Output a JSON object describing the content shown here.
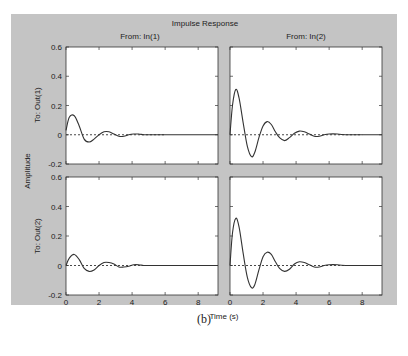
{
  "figure": {
    "title": "Impulse Response",
    "caption": "(b)",
    "xlabel": "Time (s)",
    "ylabel": "Amplitude",
    "background_color": "#c4c4c4",
    "axes_color": "#ffffff",
    "line_color": "#333333"
  },
  "chart_data": {
    "type": "line",
    "title": "Impulse Response",
    "xlabel": "Time (s)",
    "ylabel": "Amplitude",
    "xlim": [
      0,
      9.2
    ],
    "ylim": [
      -0.2,
      0.6
    ],
    "xticks": [
      0,
      2,
      4,
      6,
      8
    ],
    "yticks": [
      -0.2,
      0,
      0.2,
      0.4,
      0.6
    ],
    "ytick_labels": [
      "-0.2",
      "0",
      "0.2",
      "0.4",
      "0.6"
    ],
    "grid": false,
    "column_titles": [
      "From: In(1)",
      "From: In(2)"
    ],
    "row_titles": [
      "To: Out(1)",
      "To: Out(2)"
    ],
    "subplots": [
      {
        "row": 0,
        "col": 0,
        "from": "In(1)",
        "to": "Out(1)",
        "series": [
          {
            "name": "response",
            "style": "solid",
            "x": [
              0,
              0.2,
              0.5,
              0.8,
              1.1,
              1.4,
              1.7,
              2.0,
              2.3,
              2.6,
              2.9,
              3.2,
              3.5,
              3.8,
              4.1,
              4.4,
              4.7,
              5.0,
              5.5,
              6.0,
              9.2
            ],
            "y": [
              0.03,
              0.12,
              0.13,
              0.06,
              -0.03,
              -0.05,
              -0.03,
              0.0,
              0.02,
              0.02,
              0.005,
              -0.01,
              -0.01,
              0.0,
              0.005,
              0.005,
              0.0,
              0.0,
              0.0,
              0.0,
              0.0
            ]
          },
          {
            "name": "reference",
            "style": "dashed",
            "x": [
              0,
              6.0
            ],
            "y": [
              0,
              0
            ]
          }
        ]
      },
      {
        "row": 0,
        "col": 1,
        "from": "In(2)",
        "to": "Out(1)",
        "series": [
          {
            "name": "response",
            "style": "solid",
            "x": [
              0,
              0.15,
              0.35,
              0.55,
              0.8,
              1.05,
              1.3,
              1.5,
              1.75,
              2.0,
              2.25,
              2.5,
              2.75,
              3.0,
              3.3,
              3.6,
              3.9,
              4.2,
              4.5,
              4.8,
              5.1,
              5.4,
              5.7,
              6.0,
              6.5,
              7.0,
              9.2
            ],
            "y": [
              0.0,
              0.2,
              0.31,
              0.25,
              0.08,
              -0.08,
              -0.15,
              -0.12,
              -0.02,
              0.06,
              0.09,
              0.07,
              0.02,
              -0.02,
              -0.04,
              -0.02,
              0.01,
              0.025,
              0.02,
              0.005,
              -0.01,
              -0.01,
              0.0,
              0.005,
              0.005,
              0.0,
              0.0
            ]
          },
          {
            "name": "reference",
            "style": "dashed",
            "x": [
              0,
              8.0
            ],
            "y": [
              0,
              0
            ]
          }
        ]
      },
      {
        "row": 1,
        "col": 0,
        "from": "In(1)",
        "to": "Out(2)",
        "series": [
          {
            "name": "response",
            "style": "solid",
            "x": [
              0,
              0.2,
              0.5,
              0.8,
              1.1,
              1.4,
              1.7,
              2.0,
              2.3,
              2.6,
              2.9,
              3.2,
              3.5,
              3.8,
              4.1,
              4.4,
              4.7,
              5.0,
              5.5,
              6.0,
              9.2
            ],
            "y": [
              0.0,
              0.05,
              0.075,
              0.04,
              -0.02,
              -0.04,
              -0.03,
              0.0,
              0.02,
              0.02,
              0.01,
              -0.01,
              -0.01,
              -0.005,
              0.005,
              0.005,
              0.0,
              0.0,
              0.0,
              0.0,
              0.0
            ]
          },
          {
            "name": "reference",
            "style": "dashed",
            "x": [
              0,
              6.0
            ],
            "y": [
              0,
              0
            ]
          }
        ]
      },
      {
        "row": 1,
        "col": 1,
        "from": "In(2)",
        "to": "Out(2)",
        "series": [
          {
            "name": "response",
            "style": "solid",
            "x": [
              0,
              0.15,
              0.35,
              0.55,
              0.8,
              1.05,
              1.3,
              1.5,
              1.75,
              2.0,
              2.25,
              2.5,
              2.75,
              3.0,
              3.3,
              3.6,
              3.9,
              4.2,
              4.5,
              4.8,
              5.1,
              5.4,
              5.7,
              6.0,
              6.5,
              7.0,
              9.2
            ],
            "y": [
              0.0,
              0.22,
              0.32,
              0.26,
              0.08,
              -0.08,
              -0.15,
              -0.13,
              -0.03,
              0.06,
              0.09,
              0.075,
              0.025,
              -0.02,
              -0.04,
              -0.025,
              0.01,
              0.025,
              0.02,
              0.005,
              -0.01,
              -0.01,
              0.0,
              0.005,
              0.005,
              0.0,
              0.0
            ]
          },
          {
            "name": "reference",
            "style": "dashed",
            "x": [
              0,
              8.0
            ],
            "y": [
              0,
              0
            ]
          }
        ]
      }
    ]
  }
}
